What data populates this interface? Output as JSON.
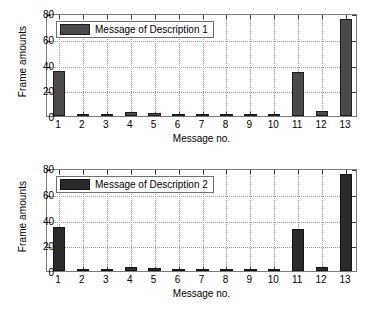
{
  "chart_data": [
    {
      "type": "bar",
      "title": "",
      "xlabel": "Message no.",
      "ylabel": "Frame amounts",
      "categories": [
        "1",
        "2",
        "3",
        "4",
        "5",
        "6",
        "7",
        "8",
        "9",
        "10",
        "11",
        "12",
        "13"
      ],
      "values": [
        35,
        1,
        1,
        3,
        2,
        1,
        1,
        1,
        1,
        1,
        34,
        4,
        75
      ],
      "series": [
        {
          "name": "Message of Description 1",
          "values": [
            35,
            1,
            1,
            3,
            2,
            1,
            1,
            1,
            1,
            1,
            34,
            4,
            75
          ]
        }
      ],
      "legend": [
        "Message of Description 1"
      ],
      "legend_position": "top-left-inside",
      "ylim": [
        0,
        80
      ],
      "yticks": [
        "0",
        "20",
        "40",
        "60",
        "80"
      ],
      "ytick_values": [
        0,
        20,
        40,
        60,
        80
      ],
      "grid": true,
      "bar_color": "#4a4a4a",
      "bar_edge_color": "#1c1c1c"
    },
    {
      "type": "bar",
      "title": "",
      "xlabel": "Message no.",
      "ylabel": "Frame amounts",
      "categories": [
        "1",
        "2",
        "3",
        "4",
        "5",
        "6",
        "7",
        "8",
        "9",
        "10",
        "11",
        "12",
        "13"
      ],
      "values": [
        34,
        1,
        1,
        3,
        2,
        1,
        1,
        1,
        1,
        1,
        33,
        3,
        75
      ],
      "series": [
        {
          "name": "Message of Description 2",
          "values": [
            34,
            1,
            1,
            3,
            2,
            1,
            1,
            1,
            1,
            1,
            33,
            3,
            75
          ]
        }
      ],
      "legend": [
        "Message of Description 2"
      ],
      "legend_position": "top-left-inside",
      "ylim": [
        0,
        80
      ],
      "yticks": [
        "0",
        "20",
        "40",
        "60",
        "80"
      ],
      "ytick_values": [
        0,
        20,
        40,
        60,
        80
      ],
      "grid": true,
      "bar_color": "#2a2a2a",
      "bar_edge_color": "#151515"
    }
  ],
  "panels": [
    {
      "id": "top",
      "ylabel": "Frame amounts",
      "xlabel": "Message no.",
      "legend_label": "Message of Description 1"
    },
    {
      "id": "bottom",
      "ylabel": "Frame amounts",
      "xlabel": "Message no.",
      "legend_label": "Message of Description 2"
    }
  ]
}
